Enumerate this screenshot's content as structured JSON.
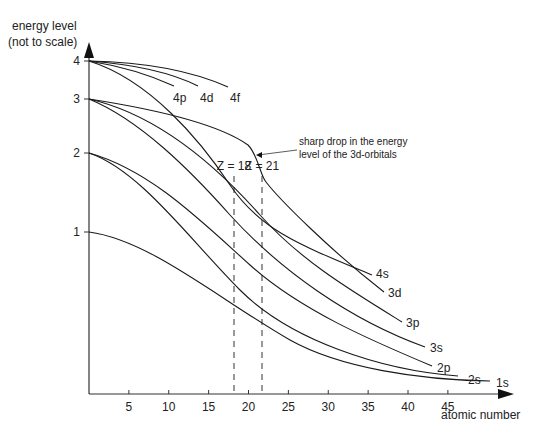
{
  "chart_data": {
    "type": "line",
    "title": "",
    "ylabel": [
      "energy level",
      "(not to scale)"
    ],
    "xlabel": "atomic number",
    "x_ticks": [
      5,
      10,
      15,
      20,
      25,
      30,
      35,
      40,
      45
    ],
    "y_ticks": [
      1,
      2,
      3,
      4
    ],
    "xlim": [
      0,
      50
    ],
    "grid": false,
    "series": [
      {
        "name": "4f",
        "start_level": 4,
        "end_z": 17
      },
      {
        "name": "4d",
        "start_level": 4,
        "end_z": 13.5
      },
      {
        "name": "4p",
        "start_level": 4,
        "end_z": 10.5
      },
      {
        "name": "4s",
        "start_level": 4,
        "end_z": 34
      },
      {
        "name": "3d",
        "start_level": 3,
        "end_z": 37
      },
      {
        "name": "3p",
        "start_level": 3,
        "end_z": 39
      },
      {
        "name": "3s",
        "start_level": 3,
        "end_z": 42
      },
      {
        "name": "2p",
        "start_level": 2,
        "end_z": 43
      },
      {
        "name": "2s",
        "start_level": 2,
        "end_z": 47
      },
      {
        "name": "1s",
        "start_level": 1,
        "end_z": 50
      }
    ],
    "markers": [
      {
        "label": "Z = 18",
        "z": 18
      },
      {
        "label": "Z = 21",
        "z": 21.5
      }
    ],
    "annotations": [
      {
        "text": [
          "sharp drop in the energy",
          "level of the 3d-orbitals"
        ],
        "target": "3d"
      }
    ]
  }
}
